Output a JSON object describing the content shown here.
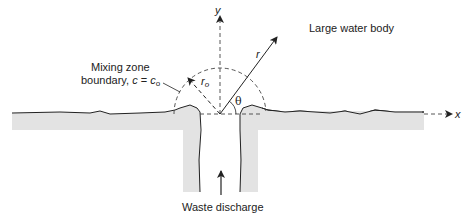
{
  "diagram": {
    "title_label": "Large water body",
    "mixing_zone_label_line1": "Mixing zone",
    "mixing_zone_label_line2_prefix": "boundary, ",
    "mixing_zone_label_c": "c",
    "mixing_zone_label_eq": " = ",
    "mixing_zone_label_c0": "c",
    "mixing_zone_label_c0_sub": "o",
    "discharge_label": "Waste discharge",
    "axis_x_label": "x",
    "axis_y_label": "y",
    "radius_label": "r",
    "radius0_label": "r",
    "radius0_sub": "o",
    "angle_label": "θ",
    "colors": {
      "land_fill": "#e3e3e3",
      "outline": "#222222",
      "dashed": "#444444"
    }
  }
}
